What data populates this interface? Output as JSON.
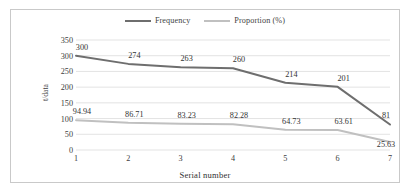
{
  "chart_data": {
    "type": "line",
    "title": "",
    "xlabel": "Serial number",
    "ylabel": "t/data",
    "categories": [
      "1",
      "2",
      "3",
      "4",
      "5",
      "6",
      "7"
    ],
    "x": [
      1,
      2,
      3,
      4,
      5,
      6,
      7
    ],
    "ylim": [
      0,
      350
    ],
    "yticks": [
      0,
      50,
      100,
      150,
      200,
      250,
      300,
      350
    ],
    "ytick_labels": [
      "0",
      "50",
      "100",
      "150",
      "200",
      "250",
      "300",
      "350"
    ],
    "grid": true,
    "legend_position": "top-center",
    "series": [
      {
        "name": "Frequency",
        "color": "#6e6e6e",
        "values": [
          300,
          274,
          263,
          260,
          214,
          201,
          81
        ],
        "labels": [
          "300",
          "274",
          "263",
          "260",
          "214",
          "201",
          "81"
        ]
      },
      {
        "name": "Proportion (%)",
        "color": "#c0c0c0",
        "values": [
          94.94,
          86.71,
          83.23,
          82.28,
          64.73,
          63.61,
          25.63
        ],
        "labels": [
          "94.94",
          "86.71",
          "83.23",
          "82.28",
          "64.73",
          "63.61",
          "25.63"
        ]
      }
    ]
  },
  "colors": {
    "frequency_line": "#6e6e6e",
    "proportion_line": "#c0c0c0",
    "gridline": "#e3e3e3",
    "border": "#c9c9c9",
    "text": "#3a3a3a"
  }
}
